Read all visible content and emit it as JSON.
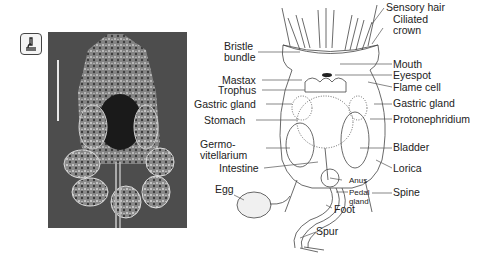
{
  "figure": {
    "icon": "microscope-icon",
    "photo": {
      "description": "micrograph of rotifer with eggs",
      "scale_bar": true
    },
    "labels_left": [
      {
        "id": "bristle-bundle",
        "text": "Bristle\nbundle",
        "line1": "Bristle",
        "line2": "bundle"
      },
      {
        "id": "mastax",
        "text": "Mastax"
      },
      {
        "id": "trophus",
        "text": "Trophus"
      },
      {
        "id": "gastric-gland-left",
        "text": "Gastric gland"
      },
      {
        "id": "stomach",
        "text": "Stomach"
      },
      {
        "id": "germovitellarium",
        "line1": "Germo-",
        "line2": "vitellarium"
      },
      {
        "id": "intestine",
        "text": "Intestine"
      },
      {
        "id": "egg",
        "text": "Egg"
      }
    ],
    "labels_right": [
      {
        "id": "sensory-hair",
        "text": "Sensory hair"
      },
      {
        "id": "ciliated-crown",
        "line1": "Ciliated",
        "line2": "crown"
      },
      {
        "id": "mouth",
        "text": "Mouth"
      },
      {
        "id": "eyespot",
        "text": "Eyespot"
      },
      {
        "id": "flame-cell",
        "text": "Flame cell"
      },
      {
        "id": "gastric-gland-right",
        "text": "Gastric gland"
      },
      {
        "id": "protonephridium",
        "text": "Protonephridium"
      },
      {
        "id": "bladder",
        "text": "Bladder"
      },
      {
        "id": "lorica",
        "text": "Lorica"
      },
      {
        "id": "spine",
        "text": "Spine"
      }
    ],
    "labels_bottom": [
      {
        "id": "anus",
        "text": "Anus"
      },
      {
        "id": "pedal-gland",
        "line1": "Pedal",
        "line2": "gland"
      },
      {
        "id": "foot",
        "text": "Foot"
      },
      {
        "id": "spur",
        "text": "Spur"
      }
    ],
    "colors": {
      "line": "#555555",
      "text": "#222222",
      "photo_bg": "#4a4a4a",
      "eyespot": "#222222"
    }
  }
}
